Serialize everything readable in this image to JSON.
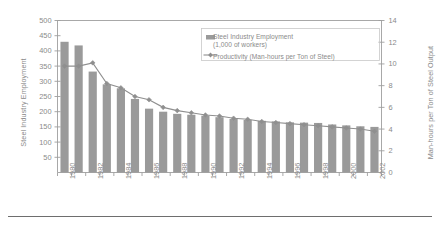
{
  "chart_data": {
    "type": "bar",
    "title": "",
    "subtitle": "",
    "xlabel": "",
    "ylabel": "Steel Industry Employment",
    "y2label": "Man-hours per Ton of Steel Output",
    "grid": false,
    "legend_position": "top-right",
    "ylim": [
      0,
      500
    ],
    "y2lim": [
      0,
      14
    ],
    "yticks": [
      50,
      100,
      150,
      200,
      250,
      300,
      350,
      400,
      450,
      500
    ],
    "y2ticks": [
      0,
      2,
      4,
      6,
      8,
      10,
      12,
      14
    ],
    "categories": [
      1980,
      1981,
      1982,
      1983,
      1984,
      1985,
      1986,
      1987,
      1988,
      1989,
      1990,
      1991,
      1992,
      1993,
      1994,
      1995,
      1996,
      1997,
      1998,
      1999,
      2000,
      2001,
      2002
    ],
    "xtick_labels": [
      "1980",
      "1982",
      "1984",
      "1986",
      "1988",
      "1990",
      "1992",
      "1994",
      "1996",
      "1998",
      "2000",
      "2002"
    ],
    "xtick_years": [
      1980,
      1982,
      1984,
      1986,
      1988,
      1990,
      1992,
      1994,
      1996,
      1998,
      2000,
      2002
    ],
    "series": [
      {
        "name": "Steel Industry Employment (1,000 of workers)",
        "type": "bar",
        "axis": "left",
        "color": "#9a9a9a",
        "values": [
          430,
          418,
          332,
          290,
          277,
          242,
          210,
          200,
          193,
          190,
          187,
          182,
          176,
          173,
          170,
          168,
          165,
          164,
          163,
          158,
          155,
          152,
          150
        ]
      },
      {
        "name": "Productivity (Man-hours per Ton of Steel)",
        "type": "line",
        "axis": "right",
        "color": "#8f8f8f",
        "marker": "diamond",
        "values": [
          9.8,
          9.8,
          10.1,
          8.2,
          7.8,
          7.0,
          6.7,
          6.0,
          5.7,
          5.5,
          5.3,
          5.2,
          5.0,
          4.9,
          4.7,
          4.6,
          4.5,
          4.4,
          4.3,
          4.2,
          4.1,
          4.0,
          3.8
        ]
      }
    ]
  },
  "legend": {
    "item1_line1": "Steel Industry Employment",
    "item1_line2": "(1,000 of workers)",
    "item2_line1": "Productivity (Man-hours per Ton of Steel)"
  },
  "colors": {
    "bar": "#9a9a9a",
    "line": "#8f8f8f",
    "axis": "#9e9e9e",
    "text": "#8a8a8a",
    "rule": "#6e6e6e"
  }
}
